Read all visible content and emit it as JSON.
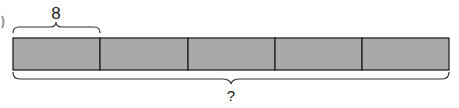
{
  "diagram": {
    "type": "tape-diagram",
    "segments": 5,
    "segment_fill": "#a9a9a9",
    "stroke": "#222222",
    "top_label": "8",
    "bottom_label": "?"
  }
}
